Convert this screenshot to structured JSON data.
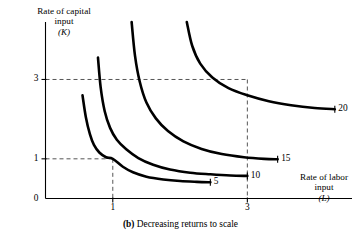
{
  "chart_data": {
    "type": "line",
    "title": "(b) Decreasing returns to scale",
    "caption_prefix": "(b)",
    "caption_text": "Decreasing returns to scale",
    "xlabel": "Rate of labor input",
    "xlabel_symbol": "(L)",
    "ylabel": "Rate of capital input",
    "ylabel_symbol": "(K)",
    "ylabel_line1": "Rate of capital",
    "ylabel_line2": "input",
    "xlabel_line1": "Rate of labor",
    "xlabel_line2": "input",
    "xticks": [
      "1",
      "3"
    ],
    "xtick_values": [
      1,
      3
    ],
    "yticks": [
      "0",
      "1",
      "3"
    ],
    "ytick_values": [
      0,
      1,
      3
    ],
    "xlim": [
      0,
      4.6
    ],
    "ylim": [
      0,
      4.6
    ],
    "grid": false,
    "legend_position": "inline-right",
    "reference_lines": [
      {
        "axis": "y",
        "value": 1,
        "style": "dashed"
      },
      {
        "axis": "y",
        "value": 3,
        "style": "dashed"
      },
      {
        "axis": "x",
        "value": 1,
        "style": "dashed"
      },
      {
        "axis": "x",
        "value": 3,
        "style": "dashed"
      }
    ],
    "annotations": [
      {
        "label": "5",
        "at_x": 1,
        "at_y": 1
      },
      {
        "label": "20",
        "at_x": 3,
        "at_y": 3
      }
    ],
    "series": [
      {
        "name": "5",
        "label": "5",
        "output": 5,
        "points": [
          [
            0.55,
            2.6
          ],
          [
            0.6,
            2.05
          ],
          [
            0.66,
            1.62
          ],
          [
            0.72,
            1.35
          ],
          [
            0.8,
            1.16
          ],
          [
            0.9,
            1.04
          ],
          [
            1.0,
            1.0
          ],
          [
            1.15,
            0.8
          ],
          [
            1.3,
            0.66
          ],
          [
            1.5,
            0.55
          ],
          [
            1.75,
            0.48
          ],
          [
            2.0,
            0.44
          ],
          [
            2.25,
            0.42
          ],
          [
            2.45,
            0.41
          ]
        ]
      },
      {
        "name": "10",
        "label": "10",
        "output": 10,
        "points": [
          [
            0.78,
            3.55
          ],
          [
            0.82,
            2.8
          ],
          [
            0.88,
            2.2
          ],
          [
            0.96,
            1.78
          ],
          [
            1.06,
            1.48
          ],
          [
            1.2,
            1.24
          ],
          [
            1.38,
            1.02
          ],
          [
            1.6,
            0.85
          ],
          [
            1.85,
            0.73
          ],
          [
            2.15,
            0.65
          ],
          [
            2.45,
            0.61
          ],
          [
            2.75,
            0.58
          ],
          [
            3.0,
            0.57
          ]
        ]
      },
      {
        "name": "15",
        "label": "15",
        "output": 15,
        "points": [
          [
            1.28,
            4.45
          ],
          [
            1.33,
            3.6
          ],
          [
            1.4,
            2.95
          ],
          [
            1.5,
            2.42
          ],
          [
            1.64,
            2.02
          ],
          [
            1.82,
            1.7
          ],
          [
            2.05,
            1.44
          ],
          [
            2.32,
            1.25
          ],
          [
            2.62,
            1.12
          ],
          [
            2.95,
            1.04
          ],
          [
            3.25,
            1.0
          ],
          [
            3.45,
            0.99
          ]
        ]
      },
      {
        "name": "20",
        "label": "20",
        "output": 20,
        "points": [
          [
            2.1,
            4.45
          ],
          [
            2.18,
            3.85
          ],
          [
            2.3,
            3.4
          ],
          [
            2.48,
            3.05
          ],
          [
            2.72,
            2.78
          ],
          [
            3.0,
            2.6
          ],
          [
            3.32,
            2.45
          ],
          [
            3.65,
            2.35
          ],
          [
            4.0,
            2.28
          ],
          [
            4.3,
            2.25
          ]
        ]
      }
    ]
  },
  "axis": {
    "y_title_line1": "Rate of capital",
    "y_title_line2": "input",
    "y_title_symbol": "(K)",
    "x_title_line1": "Rate of labor",
    "x_title_line2": "input",
    "x_title_symbol": "(L)"
  },
  "ticks": {
    "y": [
      {
        "label": "3"
      },
      {
        "label": "1"
      },
      {
        "label": "0"
      }
    ],
    "x": [
      {
        "label": "1"
      },
      {
        "label": "3"
      }
    ]
  },
  "curve_labels": [
    {
      "label": "5"
    },
    {
      "label": "10"
    },
    {
      "label": "15"
    },
    {
      "label": "20"
    }
  ],
  "caption": {
    "prefix": "(b)",
    "text": "Decreasing returns to scale"
  },
  "colors": {
    "curve": "#000000",
    "axis": "#000000",
    "dashed": "#555555",
    "background": "#ffffff"
  }
}
